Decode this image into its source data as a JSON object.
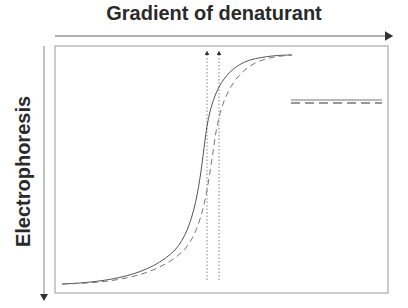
{
  "diagram": {
    "x_axis_label": "Gradient of denaturant",
    "y_axis_label": "Electrophoresis",
    "legend": [
      {
        "style": "solid",
        "label": ""
      },
      {
        "style": "dashed",
        "label": ""
      }
    ],
    "curves": [
      {
        "name": "curve-solid",
        "style": "solid",
        "color": "#555555"
      },
      {
        "name": "curve-dashed",
        "style": "dashed",
        "color": "#777777"
      }
    ],
    "markers": [
      {
        "name": "midpoint-arrow-solid",
        "style": "dotted"
      },
      {
        "name": "midpoint-arrow-dashed",
        "style": "dotted"
      }
    ],
    "colors": {
      "axis": "#666666",
      "frame": "#999999",
      "text": "#2a2a2a"
    }
  }
}
